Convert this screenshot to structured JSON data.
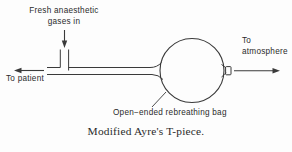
{
  "figure": {
    "caption": "Modified Ayre's T-piece.",
    "background_color": "#fdfdfd",
    "line_color": "#3a3a3a",
    "text_color": "#2b2b2b"
  },
  "labels": {
    "fresh_gas_line1": "Fresh anaesthetic",
    "fresh_gas_line2": "gases in",
    "to_patient": "To patient",
    "to_atmosphere_line1": "To",
    "to_atmosphere_line2": "atmosphere",
    "rebreathing_bag": "Open−ended rebreathing bag"
  },
  "icons": {
    "fresh_gas_arrow": "arrow-down-icon",
    "patient_arrow": "arrow-left-icon",
    "atmosphere_arrow": "arrow-right-icon",
    "leader_line": "leader-line-icon"
  },
  "components": {
    "rebreathing_bag": "circle-bag",
    "open_end": "open-end-rectangle",
    "horizontal_tube": "patient-limb-tube",
    "vertical_tube": "fresh-gas-inlet-tube"
  }
}
